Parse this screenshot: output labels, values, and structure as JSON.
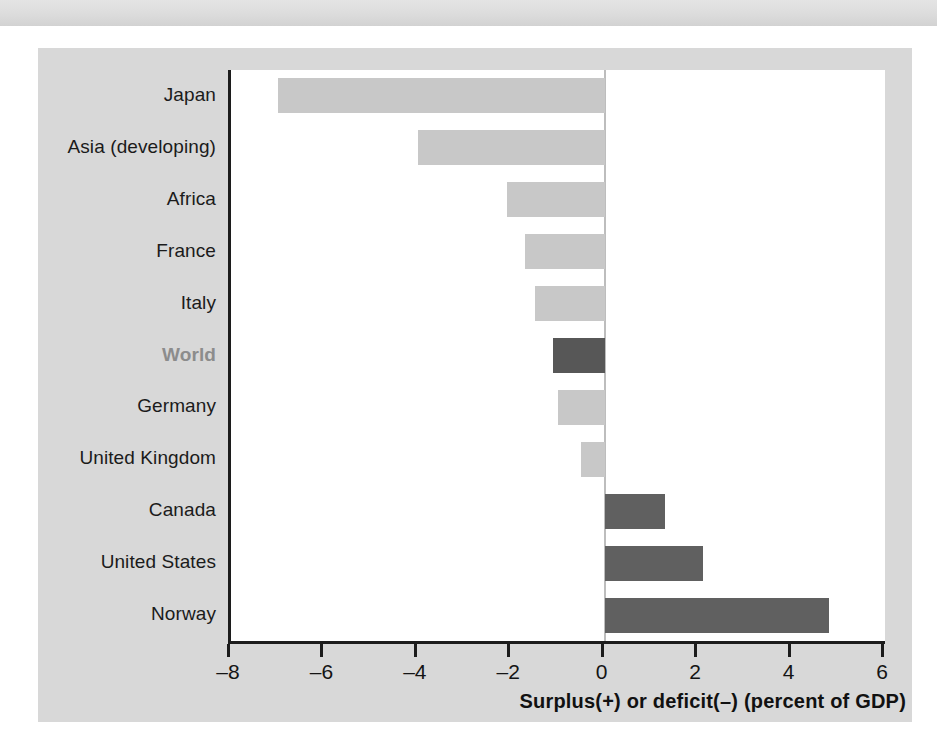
{
  "figure": {
    "background_color": "#d8d8d8",
    "plot_background_color": "#ffffff",
    "axis_color": "#1c1c1c",
    "bar_color_negative": "#c8c8c8",
    "bar_color_positive": "#606060",
    "bar_color_world": "#575757",
    "highlight_label_color": "#8c8c8c"
  },
  "chart_data": {
    "type": "bar",
    "orientation": "horizontal",
    "title": "",
    "subtitle": "",
    "xlabel": "Surplus(+) or deficit(–) (percent of GDP)",
    "ylabel": "",
    "xlim": [
      -8,
      6
    ],
    "ylim": [],
    "grid": false,
    "legend": null,
    "xticks": [
      -8,
      -6,
      -4,
      -2,
      0,
      2,
      4,
      6
    ],
    "xticklabels": [
      "–8",
      "–6",
      "–4",
      "–2",
      "0",
      "2",
      "4",
      "6"
    ],
    "categories": [
      "Japan",
      "Asia (developing)",
      "Africa",
      "France",
      "Italy",
      "World",
      "Germany",
      "United Kingdom",
      "Canada",
      "United States",
      "Norway"
    ],
    "values": [
      -7.0,
      -4.0,
      -2.1,
      -1.7,
      -1.5,
      -1.1,
      -1.0,
      -0.5,
      1.3,
      2.1,
      4.8
    ],
    "highlighted_category": "World",
    "annotations": []
  },
  "bottom_text": {
    "fragment": ""
  }
}
